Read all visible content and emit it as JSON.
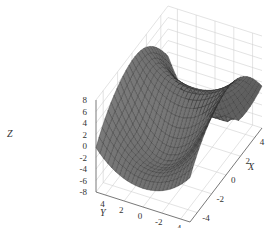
{
  "chart_data": {
    "type": "surface3d",
    "title": "",
    "xlabel": "X",
    "ylabel": "Y",
    "zlabel": "Z",
    "x_ticks": [
      -4,
      -2,
      0,
      2,
      4
    ],
    "y_ticks": [
      4,
      2,
      0,
      -2,
      -4
    ],
    "z_ticks": [
      8,
      6,
      4,
      2,
      0,
      -2,
      -4,
      -6,
      -8
    ],
    "xlim": [
      -5,
      5
    ],
    "ylim": [
      -5,
      5
    ],
    "zlim": [
      -8,
      8
    ],
    "grid": true,
    "surface_color": "#8a8a8a",
    "edge_color": "#2a2a2a",
    "grid_color": "#d0d0d0",
    "function_description": "saddle-like surface with oscillation: high ridges near Y=±4 along X, deep trough in middle front, peaks at back corners",
    "resolution": 24
  }
}
